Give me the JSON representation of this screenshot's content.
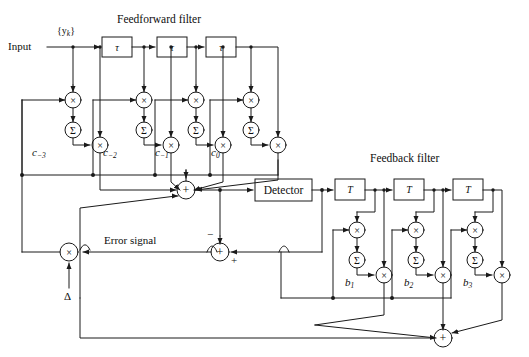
{
  "figure": {
    "kind": "decision-feedback-equalizer-block-diagram",
    "titles": {
      "feedforward": "Feedforward filter",
      "feedback": "Feedback filter"
    },
    "io": {
      "input_label": "Input",
      "sequence_label": "{y",
      "sequence_sub": "k",
      "sequence_close": "}",
      "error_label": "Error signal",
      "step_size": "Δ"
    },
    "blocks": {
      "detector": "Detector",
      "feedforward_delay": "τ",
      "feedback_delay": "T"
    },
    "feedforward_taps": [
      {
        "name": "c",
        "sub": "−3"
      },
      {
        "name": "c",
        "sub": "−2"
      },
      {
        "name": "c",
        "sub": "−1"
      },
      {
        "name": "c",
        "sub": "0"
      }
    ],
    "feedback_taps": [
      {
        "name": "b",
        "sub": "1"
      },
      {
        "name": "b",
        "sub": "2"
      },
      {
        "name": "b",
        "sub": "3"
      }
    ],
    "operators": {
      "multiply": "×",
      "sum": "+",
      "accumulate": "Σ"
    },
    "signs": {
      "minus": "−",
      "plus": "+"
    },
    "colors": {
      "line": "#1a1a1a",
      "text": "#0d0d0d",
      "background": "#ffffff"
    }
  }
}
